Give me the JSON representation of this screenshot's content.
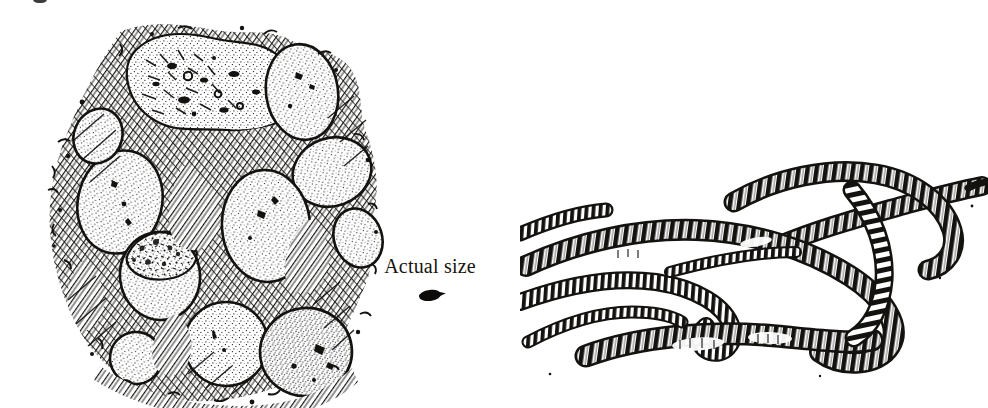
{
  "page": {
    "width": 988,
    "height": 408,
    "background_color": "#ffffff",
    "ink_color": "#141210",
    "style": "black-and-white pen-and-ink stipple and hatch line drawing (scanned book plate)"
  },
  "top_fragment": {
    "name": "cut-off-text-descender",
    "description": "faint partial ink mark clipped at the very top edge of the crop, remnant of a text line above the figure"
  },
  "caption": {
    "actual_size_label": "Actual size",
    "swatch_name": "actual-size-egg-capsule-swatch",
    "swatch_color": "#0d0b09",
    "swatch_description": "small solid dark lens/teardrop shape showing the true life size of a single egg capsule"
  },
  "illustrations": [
    {
      "name": "egg-capsule-cluster",
      "position": "left",
      "description": "Cluster of roughly ten ovoid, stippled egg capsules (cocoons) nestled within densely cross-hatched soil and crumbly earth clods",
      "egg_count": 10,
      "rendering": "stippled highlights with heavy cross-hatching and diagonal line shading for surrounding soil"
    },
    {
      "name": "earthworm-group",
      "position": "right",
      "description": "Five overlapping adult earthworms with clearly banded, segmented bodies curving across the page, tapering to pointed heads and tails",
      "worm_count": 5,
      "rendering": "heavy black segment banding with white highlights between rings"
    }
  ]
}
